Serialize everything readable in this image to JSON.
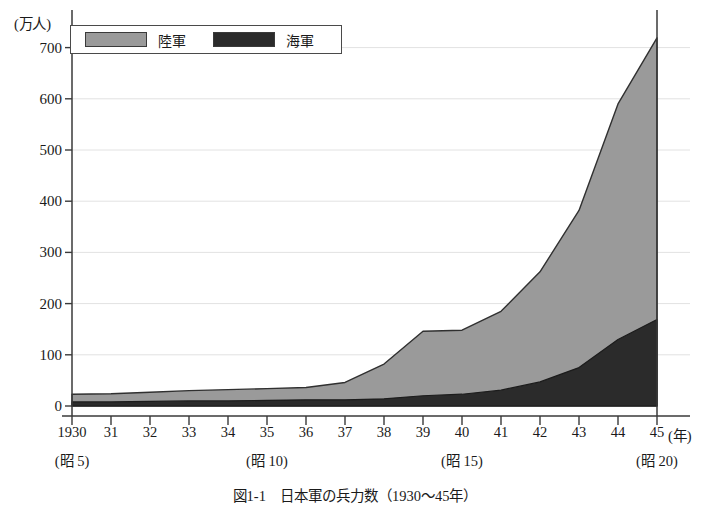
{
  "chart_data": {
    "type": "area",
    "stacked": true,
    "title": "図1-1　日本軍の兵力数（1930～45年）",
    "ylabel": "(万人)",
    "xlabel": "(年)",
    "ylim": [
      0,
      750
    ],
    "yticks": [
      0,
      100,
      200,
      300,
      400,
      500,
      600,
      700
    ],
    "ytick_labels": [
      "0",
      "100",
      "200",
      "300",
      "400",
      "500",
      "600",
      "700"
    ],
    "grid": true,
    "legend_position": "top-left",
    "x": [
      1930,
      1931,
      1932,
      1933,
      1934,
      1935,
      1936,
      1937,
      1938,
      1939,
      1940,
      1941,
      1942,
      1943,
      1944,
      1945
    ],
    "xtick_labels": [
      "1930",
      "31",
      "32",
      "33",
      "34",
      "35",
      "36",
      "37",
      "38",
      "39",
      "40",
      "41",
      "42",
      "43",
      "44",
      "45"
    ],
    "era_labels": [
      {
        "x": 1930,
        "label": "(昭 5)"
      },
      {
        "x": 1935,
        "label": "(昭 10)"
      },
      {
        "x": 1940,
        "label": "(昭 15)"
      },
      {
        "x": 1945,
        "label": "(昭 20)"
      }
    ],
    "series": [
      {
        "name": "陸軍",
        "color": "#9a9a9a",
        "values": [
          15,
          16,
          18,
          20,
          22,
          23,
          24,
          34,
          68,
          126,
          125,
          154,
          215,
          307,
          460,
          550
        ]
      },
      {
        "name": "海軍",
        "color": "#2b2b2b",
        "values": [
          8,
          8,
          9,
          10,
          10,
          11,
          12,
          12,
          14,
          20,
          23,
          31,
          47,
          75,
          130,
          169
        ]
      }
    ],
    "totals": [
      23,
      24,
      27,
      30,
      32,
      34,
      36,
      46,
      82,
      146,
      148,
      185,
      262,
      382,
      590,
      719
    ],
    "annotations": []
  },
  "legend": {
    "army_label": "陸軍",
    "navy_label": "海軍",
    "army_color": "#9a9a9a",
    "navy_color": "#2b2b2b"
  },
  "caption": {
    "text": "図1-1　日本軍の兵力数（1930～45年）"
  }
}
